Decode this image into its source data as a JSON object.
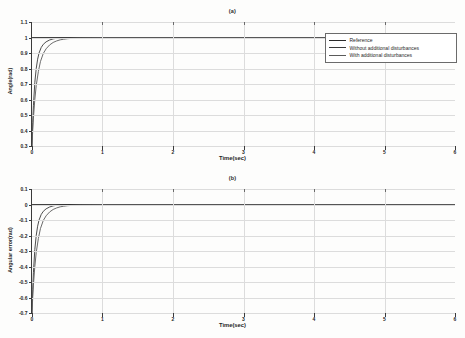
{
  "figure": {
    "background": "#ffffff",
    "axis_color": "#3b3b3b",
    "grid_color": "#dcdcdc"
  },
  "chart_data": [
    {
      "id": "a",
      "type": "line",
      "title": "(a)",
      "xlabel": "Time(sec)",
      "ylabel": "Angle(rad)",
      "xlim": [
        0,
        6
      ],
      "ylim": [
        0.3,
        1.1
      ],
      "xticks": [
        "0",
        "1",
        "2",
        "3",
        "4",
        "5",
        "6"
      ],
      "yticks": [
        "1.1",
        "1",
        "0.9",
        "0.8",
        "0.7",
        "0.6",
        "0.5",
        "0.4",
        "0.3"
      ],
      "grid": true,
      "legend_position": "upper-right",
      "series": [
        {
          "name": "Reference",
          "color": "#2b2b2b",
          "x": [
            0,
            0.001,
            6
          ],
          "values": [
            1.0,
            1.0,
            1.0
          ]
        },
        {
          "name": "Without additional disturbances",
          "color": "#3a3a3a",
          "x": [
            0,
            0.01,
            0.02,
            0.04,
            0.06,
            0.08,
            0.1,
            0.13,
            0.16,
            0.2,
            0.25,
            0.3,
            0.35,
            0.4,
            0.5,
            0.7,
            1.0,
            2.0,
            3.0,
            4.0,
            5.0,
            6.0
          ],
          "values": [
            0.3,
            0.45,
            0.56,
            0.71,
            0.8,
            0.86,
            0.9,
            0.935,
            0.956,
            0.972,
            0.984,
            0.991,
            0.995,
            0.997,
            0.999,
            1.0,
            1.0,
            1.0,
            1.0,
            1.0,
            1.0,
            1.0
          ]
        },
        {
          "name": "With additional disturbances",
          "color": "#5a5a5a",
          "x": [
            0,
            0.01,
            0.02,
            0.04,
            0.06,
            0.09,
            0.12,
            0.16,
            0.2,
            0.25,
            0.3,
            0.35,
            0.4,
            0.45,
            0.5,
            0.6,
            0.7,
            0.85,
            1.0,
            2.0,
            3.0,
            4.0,
            5.0,
            6.0
          ],
          "values": [
            0.3,
            0.4,
            0.48,
            0.6,
            0.69,
            0.78,
            0.845,
            0.897,
            0.927,
            0.952,
            0.968,
            0.978,
            0.985,
            0.989,
            0.992,
            0.996,
            0.998,
            0.999,
            1.0,
            1.0,
            1.0,
            1.0,
            1.0,
            1.0
          ]
        }
      ]
    },
    {
      "id": "b",
      "type": "line",
      "title": "(b)",
      "xlabel": "Time(sec)",
      "ylabel": "Angular error(rad)",
      "xlim": [
        0,
        6
      ],
      "ylim": [
        -0.7,
        0.1
      ],
      "xticks": [
        "0",
        "1",
        "2",
        "3",
        "4",
        "5",
        "6"
      ],
      "yticks": [
        "0.1",
        "0",
        "-0.1",
        "-0.2",
        "-0.3",
        "-0.4",
        "-0.5",
        "-0.6",
        "-0.7"
      ],
      "grid": true,
      "legend_position": "right",
      "series": [
        {
          "name": "With additional disturbances",
          "color": "#3a3a3a",
          "x": [
            0,
            0.01,
            0.02,
            0.04,
            0.06,
            0.08,
            0.1,
            0.13,
            0.16,
            0.2,
            0.25,
            0.3,
            0.35,
            0.4,
            0.5,
            0.7,
            1.0,
            2.0,
            3.0,
            4.0,
            5.0,
            6.0
          ],
          "values": [
            -0.7,
            -0.55,
            -0.44,
            -0.29,
            -0.2,
            -0.14,
            -0.1,
            -0.065,
            -0.044,
            -0.028,
            -0.016,
            -0.009,
            -0.005,
            -0.003,
            -0.001,
            0.0,
            0.0,
            0.0,
            0.0,
            0.0,
            0.0,
            0.0
          ]
        },
        {
          "name": "Reference",
          "color": "#2b2b2b",
          "x": [
            0,
            0.001,
            6
          ],
          "values": [
            0.0,
            0.0,
            0.0
          ]
        },
        {
          "name": "With additional disturbances",
          "color": "#5a5a5a",
          "x": [
            0,
            0.01,
            0.02,
            0.04,
            0.06,
            0.09,
            0.12,
            0.16,
            0.2,
            0.25,
            0.3,
            0.35,
            0.4,
            0.45,
            0.5,
            0.6,
            0.7,
            0.85,
            1.0,
            2.0,
            3.0,
            4.0,
            5.0,
            6.0
          ],
          "values": [
            -0.7,
            -0.6,
            -0.52,
            -0.4,
            -0.31,
            -0.22,
            -0.155,
            -0.103,
            -0.073,
            -0.048,
            -0.032,
            -0.022,
            -0.015,
            -0.011,
            -0.008,
            -0.004,
            -0.002,
            -0.001,
            0.0,
            0.0,
            0.0,
            0.0,
            0.0,
            0.0
          ]
        }
      ]
    }
  ]
}
